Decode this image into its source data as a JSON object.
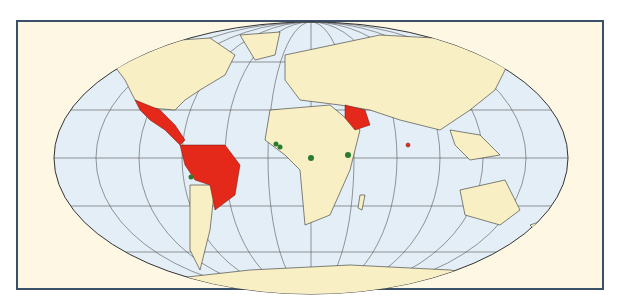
{
  "map": {
    "projection": "Robinson-like world map",
    "colors": {
      "ocean": "#e3eef6",
      "land": "#f8efc4",
      "highlight_region": "#e4291a",
      "point_marker": "#2a7a34",
      "frame_border": "#3a5068",
      "background": "#fdf7e3"
    },
    "highlighted_regions": [
      "Mexico",
      "Central America",
      "Caribbean",
      "Northern South America",
      "Brazil",
      "Arabian Peninsula",
      "Sri Lanka"
    ],
    "markers": [
      {
        "region": "West Africa coast",
        "x": 276,
        "y": 144
      },
      {
        "region": "West Africa coast 2",
        "x": 280,
        "y": 147
      },
      {
        "region": "Central Africa",
        "x": 311,
        "y": 158
      },
      {
        "region": "East Africa",
        "x": 348,
        "y": 155
      },
      {
        "region": "Peru",
        "x": 191,
        "y": 177
      }
    ]
  }
}
